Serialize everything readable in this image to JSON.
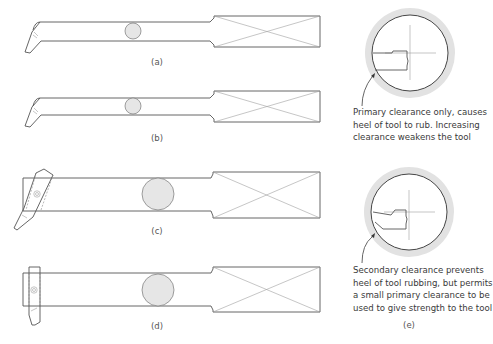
{
  "header": {
    "cropped_text": ""
  },
  "figures": {
    "a": {
      "label": "(a)"
    },
    "b": {
      "label": "(b)"
    },
    "c": {
      "label": "(c)"
    },
    "d": {
      "label": "(d)"
    },
    "e": {
      "label": "(e)",
      "caption_top": [
        "Primary clearance only, causes",
        "heel of tool to rub. Increasing",
        "clearance weakens the tool"
      ],
      "caption_bottom": [
        "Secondary clearance prevents",
        "heel of tool rubbing, but permits",
        "a small primary clearance to be",
        "used to give strength to the tool"
      ]
    }
  },
  "colors": {
    "stroke": "#555555",
    "thin_stroke": "#9a9a9a",
    "fill_circle": "#e6e6e6",
    "bore_ring": "#e2e2e2"
  }
}
